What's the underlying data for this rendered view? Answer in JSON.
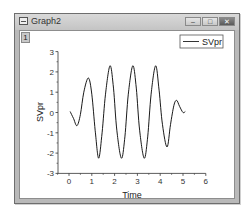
{
  "window": {
    "title": "Graph2",
    "layer_label": "1",
    "buttons": {
      "minimize": "–",
      "maximize": "□",
      "close": "✕"
    }
  },
  "chart_data": {
    "type": "line",
    "title": "",
    "xlabel": "Time",
    "ylabel": "SVpr",
    "xlim": [
      -0.5,
      6
    ],
    "ylim": [
      -3,
      3
    ],
    "xticks": [
      0,
      1,
      2,
      3,
      4,
      5,
      6
    ],
    "yticks": [
      -3,
      -2,
      -1,
      0,
      1,
      2,
      3
    ],
    "grid": false,
    "legend_position": "top-right",
    "series": [
      {
        "name": "SVpr",
        "color": "#000000",
        "x": [
          0.05,
          0.2,
          0.35,
          0.5,
          0.65,
          0.85,
          1.0,
          1.15,
          1.3,
          1.45,
          1.6,
          1.8,
          1.95,
          2.1,
          2.3,
          2.45,
          2.6,
          2.8,
          2.95,
          3.1,
          3.3,
          3.45,
          3.6,
          3.8,
          3.95,
          4.1,
          4.3,
          4.45,
          4.6,
          4.72,
          4.85,
          5.0,
          5.1
        ],
        "values": [
          0.05,
          -0.3,
          -0.65,
          -0.1,
          1.0,
          1.7,
          0.9,
          -0.9,
          -2.25,
          -1.0,
          0.9,
          2.3,
          1.2,
          -0.9,
          -2.25,
          -1.2,
          0.9,
          2.3,
          1.2,
          -0.9,
          -2.25,
          -1.2,
          0.9,
          2.3,
          1.1,
          -0.6,
          -1.7,
          -0.6,
          0.35,
          0.6,
          0.3,
          0.0,
          0.05
        ]
      }
    ]
  }
}
